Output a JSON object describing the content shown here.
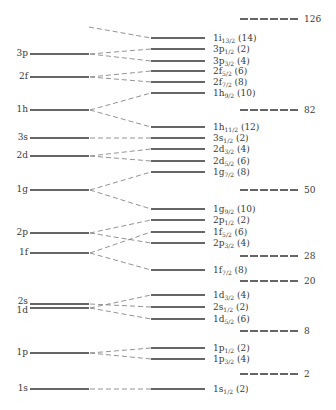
{
  "chart_data": {
    "type": "diagram",
    "title": "",
    "unperturbed_levels": [
      {
        "name": "3p",
        "y": 54
      },
      {
        "name": "2f",
        "y": 77
      },
      {
        "name": "1h",
        "y": 110
      },
      {
        "name": "3s",
        "y": 138
      },
      {
        "name": "2d",
        "y": 156
      },
      {
        "name": "1g",
        "y": 190
      },
      {
        "name": "2p",
        "y": 233
      },
      {
        "name": "1f",
        "y": 253
      },
      {
        "name": "2s",
        "y": 304
      },
      {
        "name": "1d",
        "y": 308
      },
      {
        "name": "1p",
        "y": 353
      },
      {
        "name": "1s",
        "y": 389
      }
    ],
    "split_levels": [
      {
        "orbital": "1i",
        "j": "13/2",
        "occupancy": "14",
        "y": 38,
        "from_y": 27
      },
      {
        "orbital": "3p",
        "j": "1/2",
        "occupancy": "2",
        "y": 49,
        "from_y": 54
      },
      {
        "orbital": "3p",
        "j": "3/2",
        "occupancy": "4",
        "y": 61,
        "from_y": 54
      },
      {
        "orbital": "2f",
        "j": "5/2",
        "occupancy": "6",
        "y": 71,
        "from_y": 77
      },
      {
        "orbital": "2f",
        "j": "7/2",
        "occupancy": "8",
        "y": 82,
        "from_y": 77
      },
      {
        "orbital": "1h",
        "j": "9/2",
        "occupancy": "10",
        "y": 93,
        "from_y": 110
      },
      {
        "orbital": "1h",
        "j": "11/2",
        "occupancy": "12",
        "y": 127,
        "from_y": 110
      },
      {
        "orbital": "3s",
        "j": "1/2",
        "occupancy": "2",
        "y": 138,
        "from_y": 138
      },
      {
        "orbital": "2d",
        "j": "3/2",
        "occupancy": "4",
        "y": 149,
        "from_y": 156
      },
      {
        "orbital": "2d",
        "j": "5/2",
        "occupancy": "6",
        "y": 161,
        "from_y": 156
      },
      {
        "orbital": "1g",
        "j": "7/2",
        "occupancy": "8",
        "y": 172,
        "from_y": 190
      },
      {
        "orbital": "1g",
        "j": "9/2",
        "occupancy": "10",
        "y": 209,
        "from_y": 190
      },
      {
        "orbital": "2p",
        "j": "1/2",
        "occupancy": "2",
        "y": 220,
        "from_y": 233
      },
      {
        "orbital": "1f",
        "j": "5/2",
        "occupancy": "6",
        "y": 232,
        "from_y": 253
      },
      {
        "orbital": "2p",
        "j": "3/2",
        "occupancy": "4",
        "y": 243,
        "from_y": 233
      },
      {
        "orbital": "1f",
        "j": "7/2",
        "occupancy": "8",
        "y": 270,
        "from_y": 253
      },
      {
        "orbital": "1d",
        "j": "3/2",
        "occupancy": "4",
        "y": 295,
        "from_y": 308
      },
      {
        "orbital": "2s",
        "j": "1/2",
        "occupancy": "2",
        "y": 307,
        "from_y": 304
      },
      {
        "orbital": "1d",
        "j": "5/2",
        "occupancy": "6",
        "y": 319,
        "from_y": 308
      },
      {
        "orbital": "1p",
        "j": "1/2",
        "occupancy": "2",
        "y": 348,
        "from_y": 353
      },
      {
        "orbital": "1p",
        "j": "3/2",
        "occupancy": "4",
        "y": 359,
        "from_y": 353
      },
      {
        "orbital": "1s",
        "j": "1/2",
        "occupancy": "2",
        "y": 389,
        "from_y": 389
      }
    ],
    "magic_numbers": [
      {
        "value": "126",
        "y": 19
      },
      {
        "value": "82",
        "y": 110
      },
      {
        "value": "50",
        "y": 190
      },
      {
        "value": "28",
        "y": 256
      },
      {
        "value": "20",
        "y": 281
      },
      {
        "value": "8",
        "y": 331
      },
      {
        "value": "2",
        "y": 374
      }
    ]
  },
  "layout": {
    "left_x1": 30,
    "left_x2": 89,
    "right_x1": 151,
    "right_x2": 205,
    "magic_x1": 240,
    "magic_x2": 300,
    "line_color": "#333333",
    "dash_color": "#777777"
  }
}
